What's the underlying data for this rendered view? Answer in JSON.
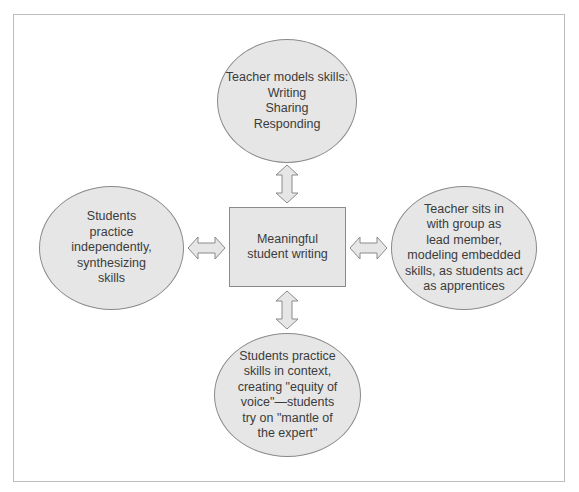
{
  "diagram": {
    "center": {
      "lines": [
        "Meaningful",
        "student writing"
      ]
    },
    "top": {
      "lines": [
        "Teacher models skills:",
        "Writing",
        "Sharing",
        "Responding"
      ]
    },
    "left": {
      "lines": [
        "Students",
        "practice",
        "independently,",
        "synthesizing",
        "skills"
      ]
    },
    "right": {
      "lines": [
        "Teacher sits in",
        "with group as",
        "lead member,",
        "modeling embedded",
        "skills, as students act",
        "as apprentices"
      ]
    },
    "bottom": {
      "lines": [
        "Students practice",
        "skills in context,",
        "creating \"equity of",
        "voice\"—students",
        "try on \"mantle of",
        "the expert\""
      ]
    },
    "colors": {
      "fill": "#e6e6e6",
      "stroke": "#8a8a8a",
      "frame": "#bdbdbd",
      "text": "#3b3b3b"
    }
  }
}
